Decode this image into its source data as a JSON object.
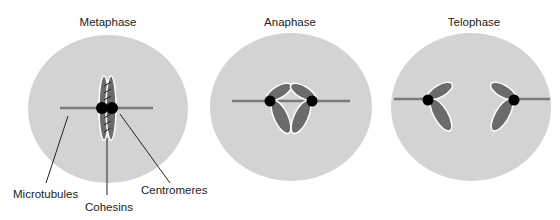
{
  "panels": [
    {
      "title": "Metaphase"
    },
    {
      "title": "Anaphase"
    },
    {
      "title": "Telophase"
    }
  ],
  "labels": {
    "microtubules": "Microtubules",
    "cohesins": "Cohesins",
    "centromeres": "Centromeres"
  },
  "colors": {
    "cell": "#d3d3d3",
    "chromosome": "#6b6b6b",
    "microtubule": "#7a7a7a",
    "centromere": "#000000",
    "outline": "#ffffff"
  }
}
